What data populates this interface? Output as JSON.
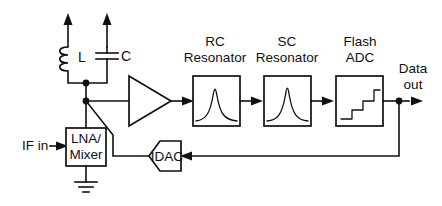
{
  "figure": {
    "background_color": "#ffffff",
    "ink_color": "#101010"
  },
  "ports": {
    "input_label": "IF in",
    "output_label_line1": "Data",
    "output_label_line2": "out"
  },
  "tank": {
    "inductor_label": "L",
    "capacitor_label": "C"
  },
  "blocks": {
    "mixer": {
      "label_line1": "LNA/",
      "label_line2": "Mixer",
      "name": "LNA/Mixer"
    },
    "amplifier": {
      "label": ""
    },
    "rc_resonator": {
      "caption_line1": "RC",
      "caption_line2": "Resonator",
      "symbol": "resonance-peak"
    },
    "sc_resonator": {
      "caption_line1": "SC",
      "caption_line2": "Resonator",
      "symbol": "resonance-peak"
    },
    "flash_adc": {
      "caption_line1": "Flash",
      "caption_line2": "ADC",
      "symbol": "staircase"
    },
    "idac": {
      "label": "IDAC"
    }
  },
  "symbols": {
    "ground": "ground-symbol",
    "junction": "junction-dot",
    "arrow": "arrow-head"
  }
}
